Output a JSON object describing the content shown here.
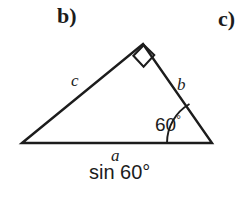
{
  "figure": {
    "part_labels": [
      {
        "name": "part-b",
        "text": "b)"
      },
      {
        "name": "part-c",
        "text": "c)"
      }
    ],
    "shape": "right triangle",
    "side_labels": {
      "hypotenuse": "c",
      "right_side": "b",
      "base": "a"
    },
    "angles": {
      "apex": {
        "marker": "right-angle-square",
        "value": "90°",
        "labeled": false
      },
      "bottom_right": {
        "marker": "arc",
        "value": "60",
        "degree_symbol": "°",
        "label": "60°"
      }
    },
    "base_expression": {
      "function": "sin",
      "argument": "60°",
      "text": "sin 60°"
    },
    "colors": {
      "ink": "#1c1c1c",
      "background": "#ffffff"
    },
    "geometry": {
      "vertex_left": [
        22,
        143
      ],
      "vertex_right": [
        212,
        143
      ],
      "vertex_apex": [
        143,
        44
      ],
      "baseline_y": 143,
      "arc_radius": 45,
      "right_angle_mark_size": 17
    }
  }
}
